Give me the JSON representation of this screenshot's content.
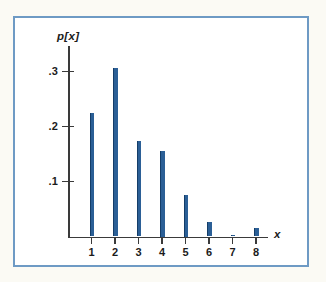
{
  "chart_data": {
    "type": "bar",
    "title": "",
    "subtitle": "",
    "xlabel": "x",
    "ylabel": "p[x]",
    "categories": [
      "1",
      "2",
      "3",
      "4",
      "5",
      "6",
      "7",
      "8"
    ],
    "x": [
      1,
      2,
      3,
      4,
      5,
      6,
      7,
      8
    ],
    "values": [
      0.224,
      0.306,
      0.173,
      0.155,
      0.075,
      0.027,
      0.002,
      0.016
    ],
    "xlim": [
      0.4,
      8.8
    ],
    "ylim": [
      0,
      0.345
    ],
    "y_ticks": [
      0.1,
      0.2,
      0.3
    ],
    "y_tick_labels": [
      ".1",
      ".2",
      ".3"
    ],
    "x_ticks": [
      1,
      2,
      3,
      4,
      5,
      6,
      7,
      8
    ],
    "x_tick_labels": [
      "1",
      "2",
      "3",
      "4",
      "5",
      "6",
      "7",
      "8"
    ],
    "grid": false,
    "legend": null,
    "annotations": [],
    "series": [
      {
        "name": "p[x]",
        "values": [
          0.224,
          0.306,
          0.173,
          0.155,
          0.075,
          0.027,
          0.002,
          0.016
        ]
      }
    ]
  },
  "style": {
    "bar_color": "#2b5f96",
    "bar_edge_color": "#143d68",
    "axis_color": "#3a3a3a",
    "frame_color": "#6e9ac4",
    "plot_background": "#ffffff",
    "page_background": "#fbfaf4",
    "text_color": "#1b1b1b"
  }
}
